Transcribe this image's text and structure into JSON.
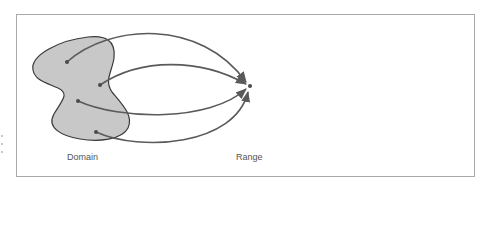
{
  "figure": {
    "domain_label": "Domain",
    "range_label": "Range",
    "domain_points": [
      {
        "id": "p1"
      },
      {
        "id": "p2"
      },
      {
        "id": "p3"
      },
      {
        "id": "p4"
      }
    ],
    "range_point": {
      "id": "target"
    },
    "mapping": "All four domain points map to a single range point",
    "colors": {
      "blob_fill": "#c8c8c8",
      "blob_stroke": "#3a3a3a",
      "arrow": "#5a5a5a",
      "frame": "#a9a9a9",
      "text": "#555555"
    }
  }
}
